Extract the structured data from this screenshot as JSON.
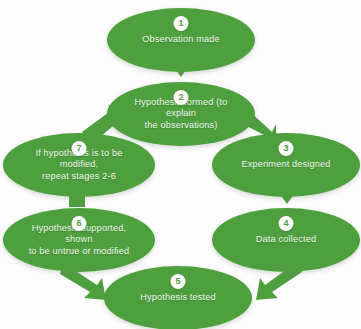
{
  "diagram": {
    "accent_color": "#4e9f3d",
    "badge_text_color": "#4e9f3d",
    "label_color": "#f2f7f0",
    "background_color": "#fdfdfd",
    "stages": [
      {
        "number": "1",
        "label": "Observation made"
      },
      {
        "number": "2",
        "label": "Hypothesis formed (to explain\nthe observations)"
      },
      {
        "number": "3",
        "label": "Experiment designed"
      },
      {
        "number": "4",
        "label": "Data collected"
      },
      {
        "number": "5",
        "label": "Hypothesis tested"
      },
      {
        "number": "6",
        "label": "Hypothesis supported, shown\nto be untrue or modified"
      },
      {
        "number": "7",
        "label": "If hypothesis is to be modified,\nrepeat stages 2-6"
      }
    ],
    "connectors": [
      {
        "from": "1",
        "to": "2",
        "direction": "down"
      },
      {
        "from": "2",
        "to": "3",
        "direction": "down-right"
      },
      {
        "from": "3",
        "to": "4",
        "direction": "down"
      },
      {
        "from": "4",
        "to": "5",
        "direction": "down-left"
      },
      {
        "from": "5",
        "to": "6",
        "direction": "up-left"
      },
      {
        "from": "6",
        "to": "7",
        "direction": "up"
      },
      {
        "from": "7",
        "to": "2",
        "direction": "up-right"
      }
    ]
  }
}
